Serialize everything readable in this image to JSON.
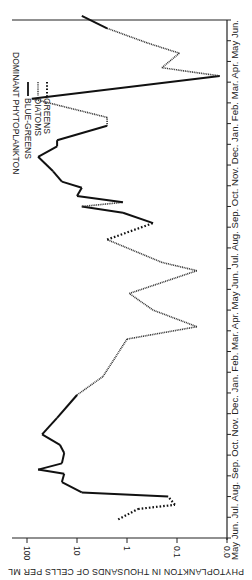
{
  "chart_data": {
    "type": "line",
    "orientation": "rotated 90° clockwise (time axis vertical, bottom = earliest)",
    "title": "",
    "xlabel": "",
    "ylabel": "PHYTOPLANKTON IN THOUSANDS OF CELLS PER ML",
    "yscale": "log",
    "ylim": [
      0.01,
      200
    ],
    "y_ticks": [
      "100",
      "10",
      "1",
      "0.1",
      "0.0"
    ],
    "x_ticks": [
      "May",
      "Jun.",
      "Jul.",
      "Aug.",
      "Sep.",
      "Oct.",
      "Nov.",
      "Dec.",
      "Jan.",
      "Feb.",
      "Mar.",
      "Apr.",
      "May",
      "Jun.",
      "Jul.",
      "Aug.",
      "Sep.",
      "Oct.",
      "Nov.",
      "Dec.",
      "Jan.",
      "Feb.",
      "Mar.",
      "Apr.",
      "May",
      "Jun."
    ],
    "legend": {
      "title": "DOMINANT PHYTOPLANKTON",
      "entries": [
        {
          "name": "BLUE-GREENS",
          "style": "solid"
        },
        {
          "name": "DIATOMS",
          "style": "fine-dotted"
        },
        {
          "name": "GREENS",
          "style": "coarse-dotted"
        }
      ],
      "position": "upper-left (rotated)"
    },
    "series_path": [
      {
        "month_index": 0.9,
        "value": 1.5,
        "dominant": "GREENS"
      },
      {
        "month_index": 1.4,
        "value": 0.6,
        "dominant": "GREENS"
      },
      {
        "month_index": 1.6,
        "value": 0.11,
        "dominant": "GREENS"
      },
      {
        "month_index": 2.0,
        "value": 0.15,
        "dominant": "GREENS"
      },
      {
        "month_index": 2.2,
        "value": 8,
        "dominant": "BLUE-GREENS"
      },
      {
        "month_index": 2.7,
        "value": 20,
        "dominant": "BLUE-GREENS"
      },
      {
        "month_index": 3.1,
        "value": 18,
        "dominant": "BLUE-GREENS"
      },
      {
        "month_index": 3.3,
        "value": 60,
        "dominant": "BLUE-GREENS"
      },
      {
        "month_index": 3.6,
        "value": 20,
        "dominant": "BLUE-GREENS"
      },
      {
        "month_index": 4.1,
        "value": 18,
        "dominant": "BLUE-GREENS"
      },
      {
        "month_index": 4.5,
        "value": 22,
        "dominant": "BLUE-GREENS"
      },
      {
        "month_index": 5.0,
        "value": 50,
        "dominant": "BLUE-GREENS"
      },
      {
        "month_index": 5.8,
        "value": 25,
        "dominant": "BLUE-GREENS"
      },
      {
        "month_index": 6.9,
        "value": 10,
        "dominant": "BLUE-GREENS"
      },
      {
        "month_index": 7.8,
        "value": 3,
        "dominant": "DIATOMS"
      },
      {
        "month_index": 9.6,
        "value": 1.0,
        "dominant": "DIATOMS"
      },
      {
        "month_index": 10.2,
        "value": 0.04,
        "dominant": "DIATOMS"
      },
      {
        "month_index": 11.0,
        "value": 0.3,
        "dominant": "DIATOMS"
      },
      {
        "month_index": 11.8,
        "value": 0.9,
        "dominant": "DIATOMS"
      },
      {
        "month_index": 12.9,
        "value": 0.04,
        "dominant": "DIATOMS"
      },
      {
        "month_index": 13.3,
        "value": 0.2,
        "dominant": "DIATOMS"
      },
      {
        "month_index": 14.4,
        "value": 2.5,
        "dominant": "DIATOMS"
      },
      {
        "month_index": 15.2,
        "value": 0.3,
        "dominant": "GREENS"
      },
      {
        "month_index": 15.7,
        "value": 1.2,
        "dominant": "BLUE-GREENS"
      },
      {
        "month_index": 16.0,
        "value": 8,
        "dominant": "BLUE-GREENS"
      },
      {
        "month_index": 16.2,
        "value": 1.2,
        "dominant": "DIATOMS"
      },
      {
        "month_index": 16.5,
        "value": 10,
        "dominant": "BLUE-GREENS"
      },
      {
        "month_index": 16.9,
        "value": 8,
        "dominant": "BLUE-GREENS"
      },
      {
        "month_index": 17.2,
        "value": 20,
        "dominant": "BLUE-GREENS"
      },
      {
        "month_index": 17.7,
        "value": 30,
        "dominant": "BLUE-GREENS"
      },
      {
        "month_index": 18.4,
        "value": 60,
        "dominant": "BLUE-GREENS"
      },
      {
        "month_index": 18.9,
        "value": 25,
        "dominant": "BLUE-GREENS"
      },
      {
        "month_index": 19.2,
        "value": 25,
        "dominant": "BLUE-GREENS"
      },
      {
        "month_index": 19.9,
        "value": 2.5,
        "dominant": "BLUE-GREENS"
      },
      {
        "month_index": 20.3,
        "value": 2.5,
        "dominant": "DIATOMS"
      },
      {
        "month_index": 21.2,
        "value": 80,
        "dominant": "DIATOMS"
      },
      {
        "month_index": 22.3,
        "value": 0.014,
        "dominant": "BLUE-GREENS"
      },
      {
        "month_index": 22.7,
        "value": 0.2,
        "dominant": "DIATOMS"
      },
      {
        "month_index": 23.4,
        "value": 0.09,
        "dominant": "DIATOMS"
      },
      {
        "month_index": 23.9,
        "value": 0.4,
        "dominant": "DIATOMS"
      },
      {
        "month_index": 24.6,
        "value": 2.5,
        "dominant": "DIATOMS"
      },
      {
        "month_index": 25.2,
        "value": 8,
        "dominant": "BLUE-GREENS"
      }
    ],
    "grid": false
  },
  "labels": {
    "ylabel": "PHYTOPLANKTON IN THOUSANDS OF CELLS PER ML",
    "legend_title": "DOMINANT PHYTOPLANKTON",
    "legend_blue": "BLUE-GREENS",
    "legend_diatoms": "DIATOMS",
    "legend_greens": "GREENS",
    "ytick_100": "100",
    "ytick_10": "10",
    "ytick_1": "1",
    "ytick_01": "0.1",
    "ytick_00": "0.0",
    "xtick_line": "May  Jun. Jul. Aug. Sep. Oct. Nov. Dec. Jan. Feb. Mar. Apr. May  Jun. Jul. Aug. Sep. Oct. Nov. Dec. Jan. Feb. Mar. Apr. May  Jun."
  }
}
